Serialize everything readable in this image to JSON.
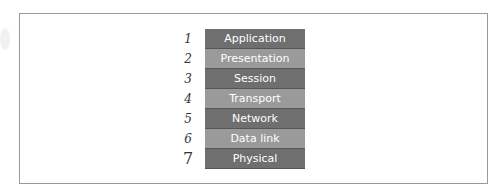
{
  "diagram": {
    "layers": [
      {
        "number": "1",
        "label": "Application",
        "shade": "dark"
      },
      {
        "number": "2",
        "label": "Presentation",
        "shade": "light"
      },
      {
        "number": "3",
        "label": "Session",
        "shade": "dark"
      },
      {
        "number": "4",
        "label": "Transport",
        "shade": "light"
      },
      {
        "number": "5",
        "label": "Network",
        "shade": "dark"
      },
      {
        "number": "6",
        "label": "Data link",
        "shade": "light"
      },
      {
        "number": "7",
        "label": "Physical",
        "shade": "dark"
      }
    ],
    "colors": {
      "dark": "#6f6f6f",
      "light": "#9a9a9a",
      "text": "#ffffff",
      "border": "#9a9a9a"
    }
  }
}
